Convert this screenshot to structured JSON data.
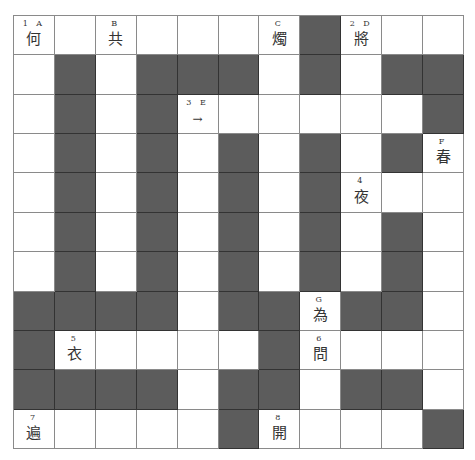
{
  "puzzle": {
    "rows": 11,
    "cols": 11,
    "colors": {
      "block": "#5c5c5c",
      "cell": "#ffffff",
      "line": "#8a8a8a",
      "text": "#333333"
    },
    "pattern": [
      "WWWWWWWBWWW",
      "WBWBBBWBWBB",
      "WBWBWWWWWWB",
      "WBWBWBWBWBW",
      "WBWBWBWBWWW",
      "WBWBWBWBWBW",
      "WBWBWBWBWBW",
      "BBBBWBBWBBW",
      "BWWWWWBWWWW",
      "BBBBWBBWBBW",
      "WWWWWBWWWWB"
    ],
    "annotated_cells": [
      {
        "row": 0,
        "col": 0,
        "label": "1 A",
        "glyph": "何"
      },
      {
        "row": 0,
        "col": 2,
        "label": "B",
        "glyph": "共"
      },
      {
        "row": 0,
        "col": 6,
        "label": "C",
        "glyph": "燭"
      },
      {
        "row": 0,
        "col": 8,
        "label": "2 D",
        "glyph": "將"
      },
      {
        "row": 2,
        "col": 4,
        "label": "3 E",
        "glyph": "→",
        "is_arrow": true
      },
      {
        "row": 3,
        "col": 10,
        "label": "F",
        "glyph": "春"
      },
      {
        "row": 4,
        "col": 8,
        "label": "4",
        "glyph": "夜"
      },
      {
        "row": 7,
        "col": 7,
        "label": "G",
        "glyph": "為"
      },
      {
        "row": 8,
        "col": 1,
        "label": "5",
        "glyph": "衣"
      },
      {
        "row": 8,
        "col": 7,
        "label": "6",
        "glyph": "問"
      },
      {
        "row": 10,
        "col": 0,
        "label": "7",
        "glyph": "遍"
      },
      {
        "row": 10,
        "col": 6,
        "label": "8",
        "glyph": "開"
      }
    ]
  }
}
